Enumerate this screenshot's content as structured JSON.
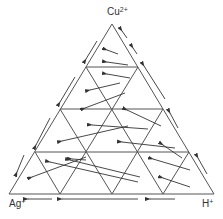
{
  "diagram": {
    "type": "ternary-diagram",
    "vertices": {
      "top": {
        "label": "Cu",
        "charge": "2+"
      },
      "bottom_left": {
        "label": "Ag",
        "charge": "+"
      },
      "bottom_right": {
        "label": "H",
        "charge": "+"
      }
    },
    "grid_divisions": 4,
    "line_color": "#444444",
    "arrow_color": "#333333"
  }
}
